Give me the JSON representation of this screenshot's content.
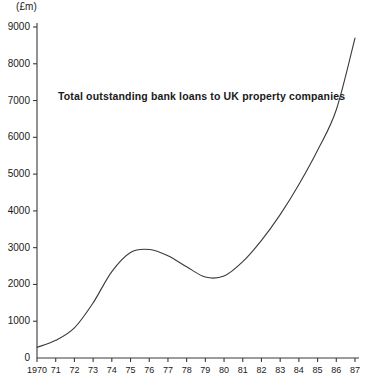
{
  "chart_data": {
    "type": "line",
    "title": "Total outstanding bank loans to UK property companies",
    "unit_label": "(£m)",
    "xlabel": "",
    "ylabel": "",
    "grid": false,
    "legend": false,
    "xlim": [
      1970,
      1987
    ],
    "ylim": [
      0,
      9000
    ],
    "ytick_step": 1000,
    "yticks": [
      0,
      1000,
      2000,
      3000,
      4000,
      5000,
      6000,
      7000,
      8000,
      9000
    ],
    "ytick_labels": [
      "0",
      "1000",
      "2000",
      "3000",
      "4000",
      "5000",
      "6000",
      "7000",
      "8000",
      "9000"
    ],
    "xticks": [
      1970,
      1971,
      1972,
      1973,
      1974,
      1975,
      1976,
      1977,
      1978,
      1979,
      1980,
      1981,
      1982,
      1983,
      1984,
      1985,
      1986,
      1987
    ],
    "xtick_labels": [
      "1970",
      "71",
      "72",
      "73",
      "74",
      "75",
      "76",
      "77",
      "78",
      "79",
      "80",
      "81",
      "82",
      "83",
      "84",
      "85",
      "86",
      "87"
    ],
    "series": [
      {
        "name": "Total outstanding bank loans to UK property companies",
        "color": "#3a3a3a",
        "x": [
          1970,
          1971,
          1972,
          1973,
          1974,
          1975,
          1976,
          1977,
          1978,
          1979,
          1980,
          1981,
          1982,
          1983,
          1984,
          1985,
          1986,
          1987
        ],
        "values": [
          290,
          480,
          820,
          1500,
          2350,
          2870,
          2950,
          2780,
          2480,
          2200,
          2230,
          2620,
          3200,
          3900,
          4720,
          5650,
          6750,
          8700
        ]
      }
    ]
  },
  "axis": {
    "tick_color": "#3a3a3a",
    "axis_color": "#3a3a3a",
    "background": "#ffffff"
  }
}
